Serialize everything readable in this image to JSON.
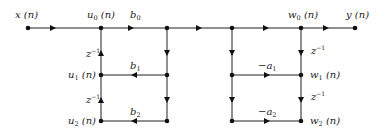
{
  "diagram": {
    "type": "signal-flow-graph",
    "colors": {
      "line": "#222222",
      "node": "#111111",
      "background": "#ffffff"
    },
    "labels": {
      "input": "x (n)",
      "output": "y (n)",
      "u0": {
        "base": "u",
        "sub": "0",
        "tail": " (n)"
      },
      "u1": {
        "base": "u",
        "sub": "1",
        "tail": " (n)"
      },
      "u2": {
        "base": "u",
        "sub": "2",
        "tail": " (n)"
      },
      "w0": {
        "base": "w",
        "sub": "0",
        "tail": " (n)"
      },
      "w1": {
        "base": "w",
        "sub": "1",
        "tail": " (n)"
      },
      "w2": {
        "base": "w",
        "sub": "2",
        "tail": " (n)"
      },
      "b0": {
        "base": "b",
        "sub": "0"
      },
      "b1": {
        "base": "b",
        "sub": "1"
      },
      "b2": {
        "base": "b",
        "sub": "2"
      },
      "a1": {
        "base": "−a",
        "sub": "1"
      },
      "a2": {
        "base": "−a",
        "sub": "2"
      },
      "delay": {
        "base": "z",
        "sup": "−1"
      }
    },
    "nodes": [
      {
        "id": "x",
        "x": 28,
        "y": 28
      },
      {
        "id": "u0",
        "x": 101,
        "y": 28
      },
      {
        "id": "u1",
        "x": 101,
        "y": 75
      },
      {
        "id": "u2",
        "x": 101,
        "y": 121
      },
      {
        "id": "a0",
        "x": 167,
        "y": 28
      },
      {
        "id": "a1n",
        "x": 167,
        "y": 75
      },
      {
        "id": "a2n",
        "x": 167,
        "y": 121
      },
      {
        "id": "c0",
        "x": 232,
        "y": 28
      },
      {
        "id": "c1",
        "x": 232,
        "y": 75
      },
      {
        "id": "c2",
        "x": 232,
        "y": 121
      },
      {
        "id": "w0",
        "x": 301,
        "y": 28
      },
      {
        "id": "w1",
        "x": 301,
        "y": 75
      },
      {
        "id": "w2",
        "x": 301,
        "y": 121
      },
      {
        "id": "y",
        "x": 355,
        "y": 28
      }
    ],
    "edges": [
      {
        "from": "x",
        "to": "u0",
        "gain": ""
      },
      {
        "from": "u0",
        "to": "a0",
        "gain": "b0"
      },
      {
        "from": "a0",
        "to": "c0",
        "gain": ""
      },
      {
        "from": "c0",
        "to": "w0",
        "gain": ""
      },
      {
        "from": "w0",
        "to": "y",
        "gain": ""
      },
      {
        "from": "u1",
        "to": "u0",
        "gain": "z^-1"
      },
      {
        "from": "u2",
        "to": "u1",
        "gain": "z^-1"
      },
      {
        "from": "a1n",
        "to": "u1",
        "gain": "b1"
      },
      {
        "from": "a2n",
        "to": "u2",
        "gain": "b2"
      },
      {
        "from": "a0",
        "to": "a1n",
        "gain": ""
      },
      {
        "from": "a1n",
        "to": "a2n",
        "gain": ""
      },
      {
        "from": "c0",
        "to": "c1",
        "gain": ""
      },
      {
        "from": "c1",
        "to": "c2",
        "gain": ""
      },
      {
        "from": "c1",
        "to": "w1",
        "gain": "-a1"
      },
      {
        "from": "c2",
        "to": "w2",
        "gain": "-a2"
      },
      {
        "from": "w0",
        "to": "w1",
        "gain": "z^-1"
      },
      {
        "from": "w1",
        "to": "w2",
        "gain": "z^-1"
      }
    ]
  }
}
